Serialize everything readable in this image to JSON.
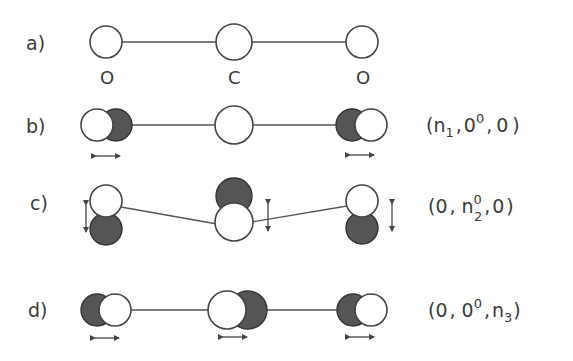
{
  "figure": {
    "rows": [
      {
        "id": "a",
        "label": "a)",
        "atom_labels": [
          "O",
          "C",
          "O"
        ],
        "mode": ""
      },
      {
        "id": "b",
        "label": "b)",
        "mode": {
          "open": "(",
          "q1": "n",
          "q1_sub": "1",
          "sep1": ",",
          "q2": "0",
          "q2_sup": "0",
          "q2_sub": "",
          "sep2": ",",
          "q3": "0",
          "q3_sub": "",
          "close": ")"
        },
        "mode_text": "(n1, 0^0, 0)",
        "description": "symmetric stretch"
      },
      {
        "id": "c",
        "label": "c)",
        "mode": {
          "open": "(",
          "q1": "0",
          "q1_sub": "",
          "sep1": ",",
          "q2": "n",
          "q2_sup": "0",
          "q2_sub": "2",
          "sep2": ",",
          "q3": "0",
          "q3_sub": "",
          "close": ")"
        },
        "mode_text": "(0, n2^0, 0)",
        "description": "bending"
      },
      {
        "id": "d",
        "label": "d)",
        "mode": {
          "open": "(",
          "q1": "0",
          "q1_sub": "",
          "sep1": ",",
          "q2": "0",
          "q2_sup": "0",
          "q2_sub": "",
          "sep2": ",",
          "q3": "n",
          "q3_sub": "3",
          "close": ")"
        },
        "mode_text": "(0, 0^0, n3)",
        "description": "asymmetric stretch"
      }
    ],
    "colors": {
      "line": "#444444",
      "dark_atom": "#555555",
      "white_atom": "#ffffff",
      "text": "#3a3a3a"
    }
  }
}
